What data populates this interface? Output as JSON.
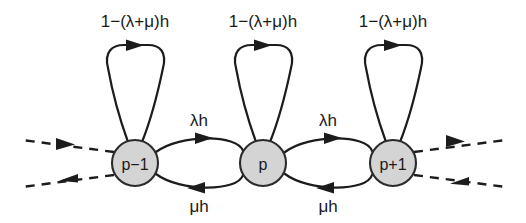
{
  "figure": {
    "kind": "markov-chain-transition-diagram",
    "background_color": "#ffffff",
    "line_color": "#1c1c1c",
    "node_fill_color": "#d4d4d4",
    "node_stroke_color": "#2b2b2b"
  },
  "nodes": [
    {
      "id": "p-minus-1",
      "label": "p−1",
      "cx": 135,
      "cy": 163,
      "r": 23
    },
    {
      "id": "p",
      "label": "p",
      "cx": 263,
      "cy": 163,
      "r": 23
    },
    {
      "id": "p-plus-1",
      "label": "p+1",
      "cx": 393,
      "cy": 163,
      "r": 23
    }
  ],
  "self_loops": [
    {
      "id": "loop-p-minus-1",
      "label": "1−(λ+μ)h",
      "label_x": 135,
      "label_y": 27
    },
    {
      "id": "loop-p",
      "label": "1−(λ+μ)h",
      "label_x": 263,
      "label_y": 27
    },
    {
      "id": "loop-p-plus-1",
      "label": "1−(λ+μ)h",
      "label_x": 393,
      "label_y": 27
    }
  ],
  "forward_edges": [
    {
      "id": "edge-forward-left",
      "label": "λh",
      "label_x": 199,
      "label_y": 126,
      "from": "p-minus-1",
      "to": "p"
    },
    {
      "id": "edge-forward-right",
      "label": "λh",
      "label_x": 328,
      "label_y": 126,
      "from": "p",
      "to": "p-plus-1"
    }
  ],
  "backward_edges": [
    {
      "id": "edge-backward-left",
      "label": "μh",
      "label_x": 199,
      "label_y": 212,
      "from": "p",
      "to": "p-minus-1"
    },
    {
      "id": "edge-backward-right",
      "label": "μh",
      "label_x": 328,
      "label_y": 212,
      "from": "p-plus-1",
      "to": "p"
    }
  ],
  "continuations": [
    {
      "id": "dashed-left-in",
      "side": "left",
      "direction": "into-node"
    },
    {
      "id": "dashed-left-out",
      "side": "left",
      "direction": "away-from-node"
    },
    {
      "id": "dashed-right-out",
      "side": "right",
      "direction": "away-from-node"
    },
    {
      "id": "dashed-right-in",
      "side": "right",
      "direction": "into-node"
    }
  ]
}
